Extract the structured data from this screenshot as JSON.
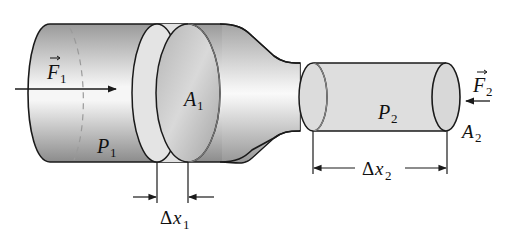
{
  "diagram": {
    "colors": {
      "outline": "#1a1a1a",
      "pipe_dark": "#8f8f8f",
      "pipe_light": "#f4f4f4",
      "fluid_band": "#dcdcdc",
      "dashed": "#9a9a9a"
    },
    "labels": {
      "force1": {
        "main": "F",
        "sub": "1",
        "vector": true
      },
      "area1": {
        "main": "A",
        "sub": "1"
      },
      "pressure1": {
        "main": "P",
        "sub": "1"
      },
      "delta_x1": {
        "delta": "Δ",
        "main": "x",
        "sub": "1"
      },
      "force2": {
        "main": "F",
        "sub": "2",
        "vector": true
      },
      "area2": {
        "main": "A",
        "sub": "2"
      },
      "pressure2": {
        "main": "P",
        "sub": "2"
      },
      "delta_x2": {
        "delta": "Δ",
        "main": "x",
        "sub": "2"
      }
    },
    "components": [
      {
        "name": "wide-pipe-section",
        "description": "Large cylinder on left with cross-sectional area A1 and pressure P1"
      },
      {
        "name": "tapered-neck",
        "description": "Converging section connecting wide and narrow pipes"
      },
      {
        "name": "narrow-pipe-section",
        "description": "Small cylinder on right with cross-sectional area A2 and pressure P2"
      },
      {
        "name": "fluid-element-1",
        "description": "Shaded slab of length Δx1 in wide section"
      },
      {
        "name": "fluid-element-2",
        "description": "Shaded column of length Δx2 in narrow section"
      }
    ]
  }
}
